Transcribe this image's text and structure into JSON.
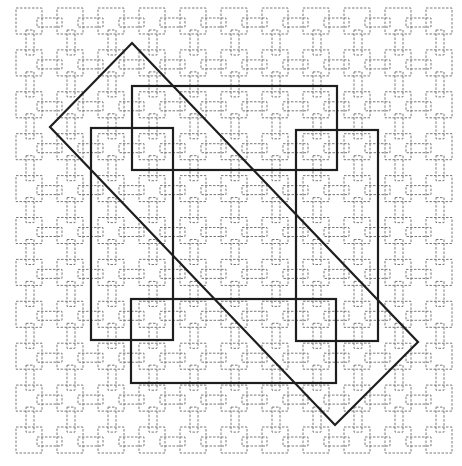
{
  "diagram": {
    "grid": {
      "columns": 11,
      "rows": 11,
      "origin_x": 16,
      "origin_y": 8,
      "period_x": 41,
      "period_y": 41.9,
      "square_size": 26,
      "h_connector": {
        "dx": 21,
        "dy": 10,
        "w": 25,
        "h": 9
      },
      "v_connector": {
        "dx": 10,
        "dy": 22,
        "w": 8,
        "h": 25
      },
      "stroke_color": "#7a7a7a"
    },
    "overlays": [
      {
        "name": "top-rectangle",
        "type": "rect",
        "x": 132,
        "y": 86,
        "w": 205,
        "h": 84
      },
      {
        "name": "left-rectangle",
        "type": "rect",
        "x": 91,
        "y": 128,
        "w": 82,
        "h": 212
      },
      {
        "name": "right-rectangle",
        "type": "rect",
        "x": 296,
        "y": 130,
        "w": 82,
        "h": 211
      },
      {
        "name": "bottom-rectangle",
        "type": "rect",
        "x": 131,
        "y": 299,
        "w": 205,
        "h": 84
      },
      {
        "name": "diagonal-rectangle",
        "type": "polygon",
        "points": "132,43 418,342 335,425 50,127"
      }
    ],
    "overlay_color": "#1e1e1e"
  }
}
